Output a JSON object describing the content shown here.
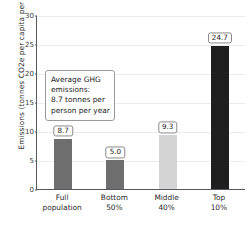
{
  "chart_data": {
    "type": "bar",
    "title": "",
    "xlabel": "",
    "ylabel": "Emissions (tonnes CO2e per capita per year)",
    "categories": [
      "Full population",
      "Bottom 50%",
      "Middle 40%",
      "Top 10%"
    ],
    "category_lines": [
      [
        "Full",
        "population"
      ],
      [
        "Bottom",
        "50%"
      ],
      [
        "Middle",
        "40%"
      ],
      [
        "Top",
        "10%"
      ]
    ],
    "values": [
      8.7,
      5.0,
      9.3,
      24.7
    ],
    "value_labels": [
      "8.7",
      "5.0",
      "9.3",
      "24.7"
    ],
    "bar_colors": [
      "#6e6e6e",
      "#6e6e6e",
      "#d4d4d4",
      "#1f1f1f"
    ],
    "ylim": [
      0,
      30
    ],
    "yticks": [
      0,
      5,
      10,
      15,
      20,
      25,
      30
    ],
    "ytick_labels": [
      "0",
      "5",
      "10",
      "15",
      "20",
      "25",
      "30"
    ],
    "grid": true,
    "legend": "none",
    "annotations": [
      {
        "name": "average-ghg-note",
        "lines": [
          "Average GHG",
          "emissions:",
          "8.7 tonnes per",
          "person per year"
        ]
      }
    ]
  },
  "colors": {
    "axis": "#55595d",
    "grid": "#ececec",
    "text": "#2b2b2b",
    "label_border": "#8a8a8a",
    "annotation_border": "#9a9a9a",
    "background": "#ffffff"
  }
}
